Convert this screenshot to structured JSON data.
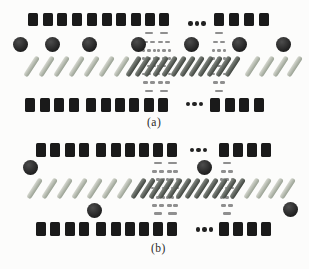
{
  "figure": {
    "width": 309,
    "height": 269,
    "background": "#fcfcfb",
    "colors": {
      "square": "#1a1a1a",
      "circle": "#2e2e2e",
      "slash_light": "#aab0a6",
      "slash_dark": "#565b52",
      "column_dash": "#8f8f8f",
      "ellipsis_dot": "#212121",
      "label_text": "#2a2a2a"
    },
    "shapes": {
      "square": "filled-rectangle-unit",
      "circle": "filled-circle-node",
      "slash": "diagonal-stroke",
      "column": "vertical-ellipsis-of-dashes",
      "ellipsis": "horizontal-three-dot-continuation"
    },
    "panels": [
      {
        "id": "a",
        "label": "(a)",
        "label_pos": {
          "x": 147,
          "y": 116
        },
        "square_w": 10,
        "top_squares": {
          "y": 12.5,
          "h": 13.5,
          "xs": [
            28,
            42.5,
            57,
            71.5,
            87,
            101.5,
            116,
            130.5,
            144.5,
            158.5,
            213.5,
            228.5,
            243.5,
            258.5
          ]
        },
        "bottom_squares": {
          "y": 97.5,
          "h": 14,
          "xs": [
            25,
            39.5,
            54,
            68.5,
            86,
            100.5,
            115,
            129,
            143.5,
            157.5,
            210,
            224.5,
            239,
            253.5
          ]
        },
        "ellipses": [
          {
            "cx": 197,
            "cy": 23.5
          },
          {
            "cx": 194.5,
            "cy": 104
          }
        ],
        "circles": [
          {
            "cx": 20.5,
            "cy": 44
          },
          {
            "cx": 52.5,
            "cy": 44
          },
          {
            "cx": 89.5,
            "cy": 44
          },
          {
            "cx": 138,
            "cy": 44
          },
          {
            "cx": 191.5,
            "cy": 44
          },
          {
            "cx": 239,
            "cy": 44
          },
          {
            "cx": 283,
            "cy": 44
          }
        ],
        "slash_cy": 66,
        "slash_groups": [
          {
            "start_cx": 31,
            "pitch": 15,
            "count": 7,
            "shade": "light"
          },
          {
            "start_cx": 133,
            "pitch": 9,
            "count": 12,
            "shade": "dark"
          },
          {
            "start_cx": 252,
            "pitch": 14,
            "count": 4,
            "shade": "light"
          }
        ],
        "columns": {
          "xs": [
            149,
            164,
            219
          ],
          "rows": [
            {
              "y": 33,
              "type": "dash"
            },
            {
              "y": 42,
              "type": "dash2"
            },
            {
              "y": 50.5,
              "type": "dots3"
            },
            {
              "y": 58.5,
              "type": "dots3"
            },
            {
              "y": 66,
              "type": "dots3"
            },
            {
              "y": 74,
              "type": "dots3"
            },
            {
              "y": 82.5,
              "type": "dash2"
            },
            {
              "y": 91,
              "type": "dash"
            }
          ]
        }
      },
      {
        "id": "b",
        "label": "(b)",
        "label_pos": {
          "x": 151,
          "y": 242
        },
        "square_w": 10,
        "top_squares": {
          "y": 142.5,
          "h": 14,
          "xs": [
            35.5,
            50,
            64.5,
            78.5,
            96,
            110.5,
            124.5,
            138.5,
            152.5,
            166.5,
            218.5,
            232.5,
            246.5,
            261
          ]
        },
        "bottom_squares": {
          "y": 221.5,
          "h": 14.5,
          "xs": [
            35.5,
            50,
            64.5,
            78.5,
            96,
            110.5,
            124.5,
            138.5,
            152.5,
            166.5,
            218.5,
            232.5,
            246.5,
            261
          ]
        },
        "ellipses": [
          {
            "cx": 198.5,
            "cy": 150
          },
          {
            "cx": 204.5,
            "cy": 229.5
          }
        ],
        "circles": [
          {
            "cx": 30.8,
            "cy": 167
          },
          {
            "cx": 204,
            "cy": 167.5
          },
          {
            "cx": 94,
            "cy": 210.5
          },
          {
            "cx": 290,
            "cy": 209
          }
        ],
        "slash_cy": 188,
        "slash_groups": [
          {
            "start_cx": 34,
            "pitch": 15,
            "count": 7,
            "shade": "light"
          },
          {
            "start_cx": 138,
            "pitch": 9,
            "count": 12,
            "shade": "dark"
          },
          {
            "start_cx": 251,
            "pitch": 12,
            "count": 4,
            "shade": "light"
          }
        ],
        "columns": {
          "xs": [
            158,
            172.5,
            227
          ],
          "rows": [
            {
              "y": 163,
              "type": "dash"
            },
            {
              "y": 171.5,
              "type": "dash2"
            },
            {
              "y": 179.5,
              "type": "dots3"
            },
            {
              "y": 188,
              "type": "dots3"
            },
            {
              "y": 197.5,
              "type": "dots3"
            },
            {
              "y": 205.5,
              "type": "dash2"
            },
            {
              "y": 213.5,
              "type": "dash"
            }
          ]
        }
      }
    ]
  }
}
